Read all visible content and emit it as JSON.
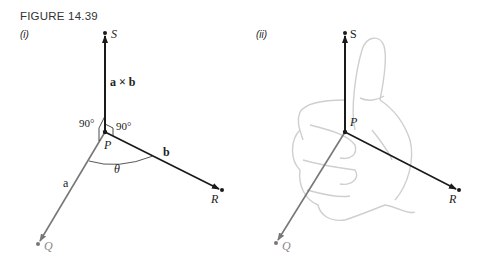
{
  "figure": {
    "title": "FIGURE 14.39",
    "panels": [
      {
        "label": "(i)",
        "points": {
          "S": "S",
          "P": "P",
          "Q": "Q",
          "R": "R"
        },
        "cross_label": "a × b",
        "vec_a": "a",
        "vec_b": "b",
        "angle_left": "90°",
        "angle_right": "90°",
        "theta": "θ"
      },
      {
        "label": "(ii)",
        "points": {
          "S": "S",
          "P": "P",
          "Q": "Q",
          "R": "R"
        },
        "illustration": "right-hand-thumb-up"
      }
    ],
    "colors": {
      "vector_dark": "#1a1a1a",
      "vector_gray": "#777777",
      "hand_outline": "#cfcfcf"
    }
  }
}
